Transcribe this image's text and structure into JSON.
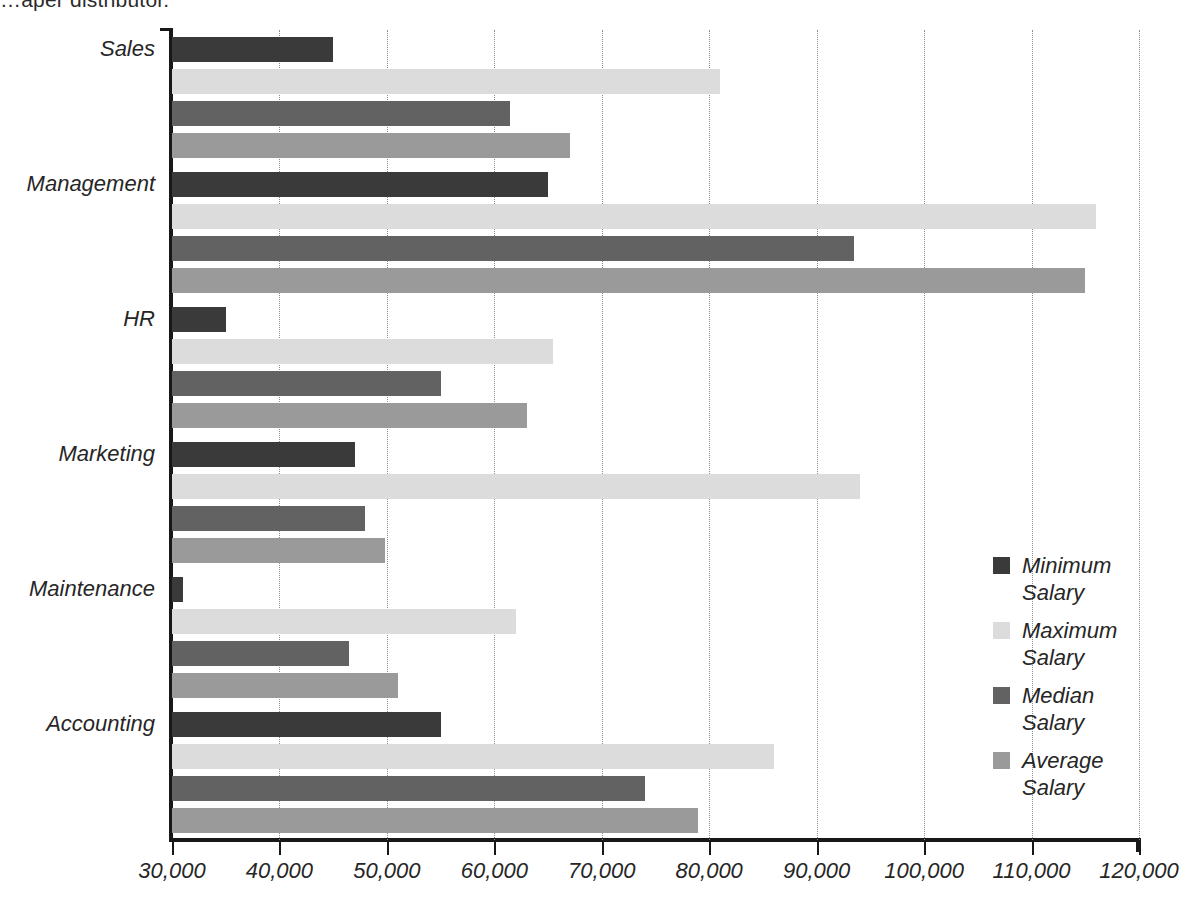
{
  "caption": "…aper distributor.",
  "chart_data": {
    "type": "bar",
    "orientation": "horizontal",
    "title": "",
    "xlabel": "",
    "ylabel": "",
    "xlim": [
      30000,
      120000
    ],
    "xticks": [
      "30,000",
      "40,000",
      "50,000",
      "60,000",
      "70,000",
      "80,000",
      "90,000",
      "100,000",
      "110,000",
      "120,000"
    ],
    "xtick_values": [
      30000,
      40000,
      50000,
      60000,
      70000,
      80000,
      90000,
      100000,
      110000,
      120000
    ],
    "grid": true,
    "grid_style": "dotted vertical",
    "legend_position": "right",
    "categories": [
      "Sales",
      "Management",
      "HR",
      "Marketing",
      "Maintenance",
      "Accounting"
    ],
    "series": [
      {
        "name": "Minimum Salary",
        "color": "#3a3a3a",
        "values": [
          45000,
          65000,
          35000,
          47000,
          31000,
          55000
        ]
      },
      {
        "name": "Maximum Salary",
        "color": "#dcdcdc",
        "values": [
          81000,
          116000,
          65500,
          94000,
          62000,
          86000
        ]
      },
      {
        "name": "Median Salary",
        "color": "#626262",
        "values": [
          61500,
          93500,
          55000,
          48000,
          46500,
          74000
        ]
      },
      {
        "name": "Average Salary",
        "color": "#9a9a9a",
        "values": [
          67000,
          115000,
          63000,
          49800,
          51000,
          79000
        ]
      }
    ]
  },
  "legend": {
    "items": [
      {
        "label_line1": "Minimum",
        "label_line2": "Salary",
        "color": "#3a3a3a"
      },
      {
        "label_line1": "Maximum",
        "label_line2": "Salary",
        "color": "#dcdcdc"
      },
      {
        "label_line1": "Median",
        "label_line2": "Salary",
        "color": "#626262"
      },
      {
        "label_line1": "Average",
        "label_line2": "Salary",
        "color": "#9a9a9a"
      }
    ]
  }
}
